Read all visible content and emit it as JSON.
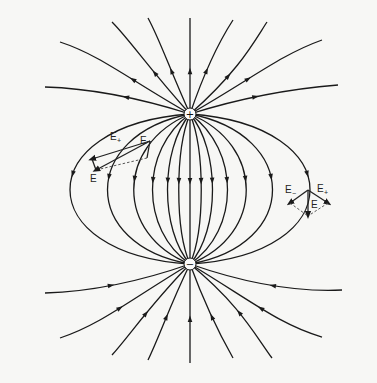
{
  "diagram": {
    "background": "#f7f7f5",
    "line_color": "#1a1a1a",
    "charges": [
      {
        "id": "positive",
        "sign": "+",
        "x": 190,
        "y": 114,
        "r": 6
      },
      {
        "id": "negative",
        "sign": "−",
        "x": 190,
        "y": 264,
        "r": 6
      }
    ],
    "labels": {
      "left_e_plus": "E",
      "left_e_plus_sub": "+",
      "left_e_minus": "E",
      "left_e_minus_sub": "−",
      "left_e": "E",
      "right_e_minus": "E",
      "right_e_minus_sub": "−",
      "right_e_plus": "E",
      "right_e_plus_sub": "+",
      "right_e": "E"
    },
    "field_lines": [
      "M190,114 L190,264",
      "M190,114 C175,150 175,230 190,264",
      "M190,114 C160,150 160,230 190,264",
      "M190,114 C140,150 140,230 190,264",
      "M190,114 C115,145 115,235 190,264",
      "M190,114 C80,135 80,245 190,264",
      "M190,114 C30,125 30,255 190,264",
      "M190,114 C205,150 205,230 190,264",
      "M190,114 C220,150 220,230 190,264",
      "M190,114 C240,150 240,230 190,264",
      "M190,114 C265,145 265,235 190,264",
      "M190,114 C300,135 300,245 190,264",
      "M190,114 C350,125 350,255 190,264",
      "M190,114 C170,70 160,40 148,18",
      "M190,114 C190,80 190,40 190,18",
      "M190,114 C205,70 220,40 233,20",
      "M190,114 C150,70 130,40 112,22",
      "M190,114 C240,70 255,40 267,22",
      "M190,114 C130,80 100,55 60,42",
      "M190,114 C250,80 280,55 322,40",
      "M190,114 C130,95 80,88 45,87",
      "M190,114 C250,95 300,88 338,85",
      "M190,264 C170,305 160,335 148,360",
      "M190,264 C190,300 190,340 190,363",
      "M190,264 C205,305 220,335 233,358",
      "M190,264 C150,305 130,335 112,355",
      "M190,264 C240,305 255,335 272,358",
      "M190,264 C130,300 100,325 60,338",
      "M190,264 C250,300 280,325 322,337",
      "M190,264 C130,285 80,292 45,293",
      "M190,264 C250,285 300,292 342,290"
    ]
  }
}
